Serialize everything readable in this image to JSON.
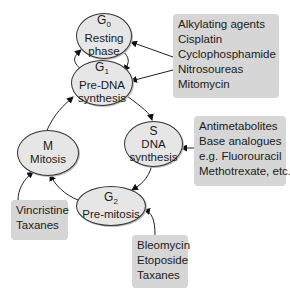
{
  "diagram": {
    "phases": {
      "g0": {
        "symbol": "G",
        "sub": "0",
        "line1": "Resting",
        "line2": "phase"
      },
      "g1": {
        "symbol": "G",
        "sub": "1",
        "line1": "Pre-DNA",
        "line2": "synthesis"
      },
      "s": {
        "symbol": "S",
        "line1": "DNA",
        "line2": "synthesis"
      },
      "g2": {
        "symbol": "G",
        "sub": "2",
        "line1": "Pre-mitosis"
      },
      "m": {
        "symbol": "M",
        "line1": "Mitosis"
      }
    },
    "drug_boxes": {
      "g0_g1": [
        "Alkylating agents",
        "Cisplatin",
        "Cyclophosphamide",
        "Nitrosoureas",
        "Mitomycin"
      ],
      "s": [
        "Antimetabolites",
        "Base analogues",
        "e.g. Fluorouracil",
        "Methotrexate, etc."
      ],
      "m": [
        "Vincristine",
        "Taxanes"
      ],
      "g2": [
        "Bleomycin",
        "Etoposide",
        "Taxanes"
      ]
    },
    "edges": [
      {
        "from": "G1",
        "to": "G0"
      },
      {
        "from": "G0",
        "to": "G1"
      },
      {
        "from": "G1",
        "to": "S"
      },
      {
        "from": "S",
        "to": "G2"
      },
      {
        "from": "G2",
        "to": "M"
      },
      {
        "from": "M",
        "to": "G1"
      },
      {
        "from": "Alkylating box",
        "to": "G0"
      },
      {
        "from": "Alkylating box",
        "to": "G1"
      },
      {
        "from": "Antimetabolites box",
        "to": "S"
      },
      {
        "from": "Vincristine box",
        "to": "M"
      },
      {
        "from": "Bleomycin box",
        "to": "G2"
      }
    ],
    "colors": {
      "phase_fill": "#e6e6e6",
      "box_fill": "#d6d6d6",
      "stroke": "#333333"
    }
  }
}
